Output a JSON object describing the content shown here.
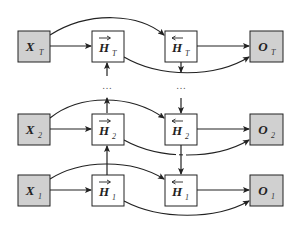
{
  "diagram": {
    "colors": {
      "input_fill": "#d0d0d0",
      "output_fill": "#d0d0d0",
      "hidden_fill": "#ffffff",
      "stroke": "#222222"
    },
    "rows": [
      {
        "id": "T",
        "input": {
          "main": "X",
          "sub": "T"
        },
        "forward": {
          "main": "H",
          "sub": "T",
          "arrow": "→"
        },
        "backward": {
          "main": "H",
          "sub": "T",
          "arrow": "←"
        },
        "output": {
          "main": "O",
          "sub": "T"
        }
      },
      {
        "id": "2",
        "input": {
          "main": "X",
          "sub": "2"
        },
        "forward": {
          "main": "H",
          "sub": "2",
          "arrow": "→"
        },
        "backward": {
          "main": "H",
          "sub": "2",
          "arrow": "←"
        },
        "output": {
          "main": "O",
          "sub": "2"
        }
      },
      {
        "id": "1",
        "input": {
          "main": "X",
          "sub": "1"
        },
        "forward": {
          "main": "H",
          "sub": "1",
          "arrow": "→"
        },
        "backward": {
          "main": "H",
          "sub": "1",
          "arrow": "←"
        },
        "output": {
          "main": "O",
          "sub": "1"
        }
      }
    ],
    "ellipsis": "…",
    "edges": [
      "X_t -> forward H_t",
      "X_t -> backward H_t",
      "forward H_t -> O_t",
      "backward H_t -> O_t",
      "forward H_1 -> forward H_2 -> ... -> forward H_T",
      "backward H_T -> ... -> backward H_2 -> backward H_1"
    ]
  }
}
